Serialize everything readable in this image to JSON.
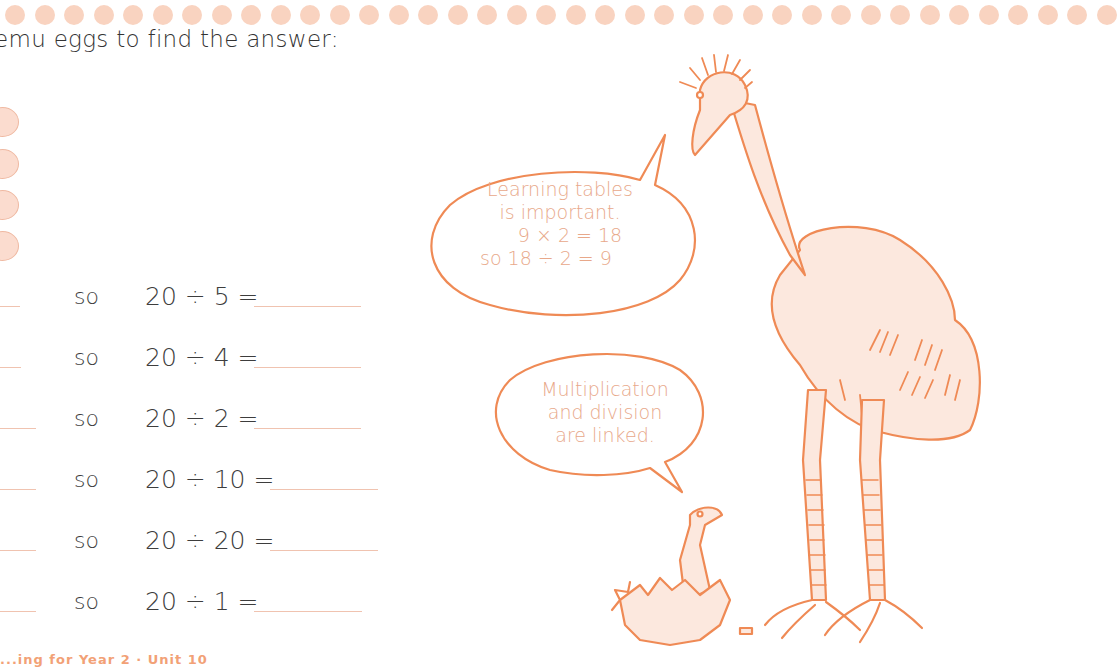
{
  "page": {
    "instruction": "emu eggs to find the answer:",
    "egg_count": 4,
    "connector_word": "so",
    "equations": [
      {
        "text": "20 ÷ 5 =",
        "answer": ""
      },
      {
        "text": "20 ÷ 4 =",
        "answer": ""
      },
      {
        "text": "20 ÷ 2 =",
        "answer": ""
      },
      {
        "text": "20 ÷ 10 =",
        "answer": ""
      },
      {
        "text": "20 ÷ 20 =",
        "answer": ""
      },
      {
        "text": "20 ÷ 1 =",
        "answer": ""
      }
    ],
    "footer": "...ing for Year 2 · Unit 10"
  },
  "illustration": {
    "speech_bubble_adult": {
      "line1": "Learning tables",
      "line2": "is important.",
      "line3": "9 × 2 = 18",
      "line4": "so 18 ÷ 2 = 9"
    },
    "speech_bubble_chick": {
      "line1": "Multiplication",
      "line2": "and division",
      "line3": "are linked."
    }
  },
  "colors": {
    "accent": "#ef8a55",
    "dot": "#f9d3c0",
    "egg_fill": "#fbdccf",
    "bubble_text": "#e8a88a",
    "emu_fill": "#fce8de"
  }
}
